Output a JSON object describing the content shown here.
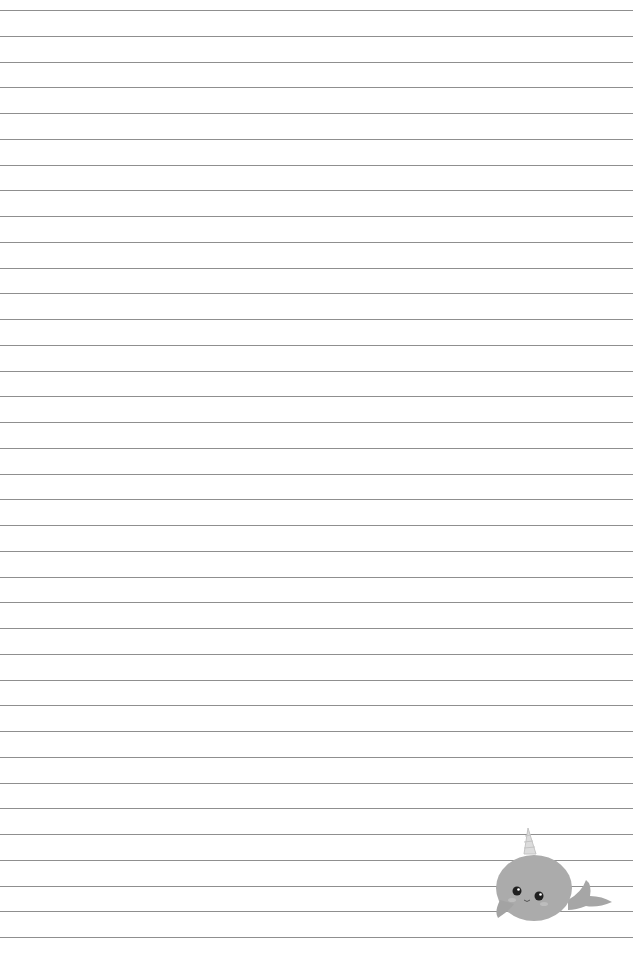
{
  "page": {
    "type": "lined-paper",
    "background": "#ffffff",
    "line_color": "#8f8f8f",
    "line_count": 37,
    "first_line_y": 10,
    "line_spacing": 25.75
  },
  "illustration": {
    "subject": "narwhal",
    "body_color": "#a9a9a9",
    "horn_color": "#d8d8d8",
    "eye_color": "#222222"
  }
}
